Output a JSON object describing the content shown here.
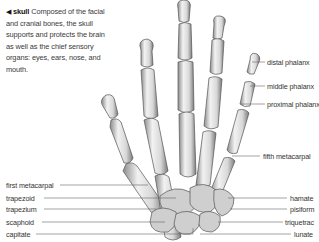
{
  "intro": {
    "arrow": "◀",
    "heading": "skull",
    "text": " Composed of the facial and cranial bones, the skull supports and protects the brain as well as the chief sensory organs: eyes, ears, nose, and mouth."
  },
  "labels_right": [
    {
      "id": "distal-phalanx",
      "text": "distal phalanx"
    },
    {
      "id": "middle-phalanx",
      "text": "middle phalanx"
    },
    {
      "id": "proximal-phalanx",
      "text": "proximal phalanx"
    },
    {
      "id": "fifth-metacarpal",
      "text": "fifth metacarpal"
    },
    {
      "id": "hamate",
      "text": "hamate"
    },
    {
      "id": "pisiform",
      "text": "pisiform"
    },
    {
      "id": "triquetrac",
      "text": "triquetrac"
    },
    {
      "id": "lunate",
      "text": "lunate"
    }
  ],
  "labels_left": [
    {
      "id": "first-metacarpal",
      "text": "first metacarpal"
    },
    {
      "id": "trapezoid",
      "text": "trapezoid"
    },
    {
      "id": "trapezium",
      "text": "trapezium"
    },
    {
      "id": "scaphoid",
      "text": "scaphoid"
    },
    {
      "id": "capitate",
      "text": "capitate"
    }
  ],
  "colors": {
    "bone_fill": "#e6e6e6",
    "bone_shade": "#9a9a9a",
    "bone_outline": "#555555",
    "leader_line": "#666666",
    "text": "#333333"
  }
}
